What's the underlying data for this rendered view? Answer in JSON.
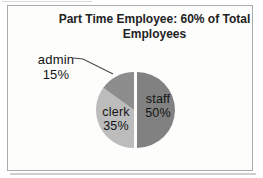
{
  "chart": {
    "title": "Part Time Employee: 60% of Total Employees"
  },
  "chart_data": {
    "type": "pie",
    "title": "Part Time Employee: 60% of Total Employees",
    "start_angle_deg": 0,
    "direction": "clockwise",
    "legend": "none",
    "data_labels": "category name and percentage",
    "slices": [
      {
        "label": "staff",
        "value": 50,
        "pct_text": "50%",
        "color": "#818181",
        "exploded": true,
        "label_position": "inside"
      },
      {
        "label": "clerk",
        "value": 35,
        "pct_text": "35%",
        "color": "#bcbcbc",
        "exploded": false,
        "label_position": "inside"
      },
      {
        "label": "admin",
        "value": 15,
        "pct_text": "15%",
        "color": "#8d8d8d",
        "exploded": false,
        "label_position": "outside-left",
        "leader_line": true
      }
    ]
  }
}
